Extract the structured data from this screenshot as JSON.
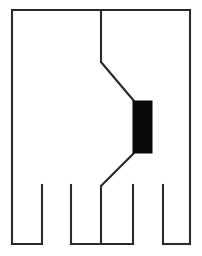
{
  "figure": {
    "canvas": {
      "width": 202,
      "height": 256
    },
    "colors": {
      "background": "#ffffff",
      "stroke": "#2b2b2b",
      "solid_fill": "#0a0a0a"
    },
    "stroke_width": 2.1,
    "shapes": {
      "outline": {
        "name": "body-outline",
        "points": "12,10 101,10 101,62 134,101 134,153 101,186 101,244 12,244",
        "closed": false
      },
      "outline_right": {
        "name": "body-outline-right",
        "points": "190,10 190,244",
        "closed": false
      },
      "outline_top_right": {
        "name": "body-outline-top-right",
        "points": "101,10 190,10",
        "closed": false
      },
      "outline_bottom_right": {
        "name": "body-outline-bottom-right",
        "points": "101,244 190,244",
        "closed": false
      },
      "solid_block": {
        "name": "solid-black-block",
        "x": 133,
        "y": 101,
        "width": 19,
        "height": 52
      },
      "slots": [
        {
          "name": "slot-left",
          "left": 42,
          "right": 71,
          "top": 185,
          "bottom": 244
        },
        {
          "name": "slot-middle",
          "left": 133,
          "right": 163,
          "top": 185,
          "bottom": 244
        }
      ],
      "slot_walls": [
        {
          "name": "slot-wall-1",
          "x": 42,
          "top": 185,
          "bottom": 244
        },
        {
          "name": "slot-wall-2",
          "x": 71,
          "top": 185,
          "bottom": 244
        },
        {
          "name": "slot-wall-3",
          "x": 133,
          "top": 185,
          "bottom": 244
        },
        {
          "name": "slot-wall-4",
          "x": 163,
          "top": 185,
          "bottom": 244
        }
      ],
      "bottom_edges": [
        {
          "name": "bottom-edge-leg-1",
          "x1": 12,
          "x2": 42,
          "y": 244
        },
        {
          "name": "bottom-edge-leg-2",
          "x1": 71,
          "x2": 101,
          "y": 244
        },
        {
          "name": "bottom-edge-leg-3",
          "x1": 101,
          "x2": 133,
          "y": 244
        },
        {
          "name": "bottom-edge-leg-4",
          "x1": 163,
          "x2": 190,
          "y": 244
        }
      ]
    }
  }
}
